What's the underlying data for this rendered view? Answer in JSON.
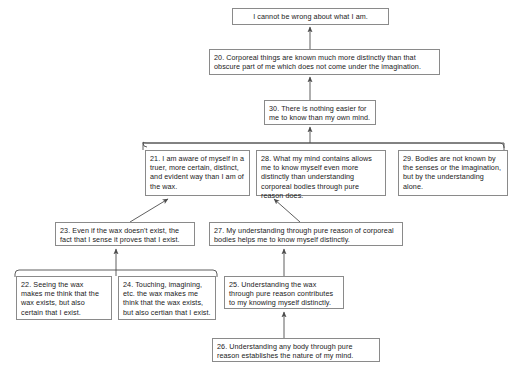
{
  "diagram": {
    "style": {
      "box_border_color": "#8a8a8a",
      "box_fill_color": "#ffffff",
      "text_color": "#1a1a1a",
      "edge_color": "#4d4d4d",
      "background_color": "#ffffff"
    },
    "nodes": [
      {
        "id": "conclusion",
        "number": "",
        "text": "I cannot be wrong about what I am.",
        "x": 232,
        "y": 8,
        "w": 157,
        "h": 17,
        "align": "center"
      },
      {
        "id": "n20",
        "number": "20",
        "text": "20. Corporeal things are known much more distinctly than that obscure part of me which does not come under the imagination.",
        "x": 209,
        "y": 49,
        "w": 231,
        "h": 26,
        "align": "left"
      },
      {
        "id": "n30",
        "number": "30",
        "text": "30. There is nothing easier for me to know than my own mind.",
        "x": 264,
        "y": 100,
        "w": 112,
        "h": 25,
        "align": "left"
      },
      {
        "id": "n21",
        "number": "21",
        "text": "21. I am aware of myself in a truer, more certain, distinct, and evident way than I am of the wax.",
        "x": 145,
        "y": 150,
        "w": 105,
        "h": 46,
        "align": "left"
      },
      {
        "id": "n28",
        "number": "28",
        "text": "28. What my mind contains allows me to know myself even more distinctly than understanding corporeal bodies through pure reason does.",
        "x": 256,
        "y": 150,
        "w": 130,
        "h": 46,
        "align": "left"
      },
      {
        "id": "n29",
        "number": "29",
        "text": "29. Bodies are not known by the senses or the imagination, but by the understanding alone.",
        "x": 398,
        "y": 150,
        "w": 110,
        "h": 46,
        "align": "left"
      },
      {
        "id": "n23",
        "number": "23",
        "text": "23. Even if the wax doesn't exist, the fact that I sense it proves that I exist.",
        "x": 55,
        "y": 222,
        "w": 140,
        "h": 24,
        "align": "left"
      },
      {
        "id": "n27",
        "number": "27",
        "text": "27. My understanding through pure reason of corporeal bodies helps me to know myself distinctly.",
        "x": 209,
        "y": 222,
        "w": 194,
        "h": 24,
        "align": "left"
      },
      {
        "id": "n22",
        "number": "22",
        "text": "22. Seeing the wax makes me think that the wax exists, but also certain that I exist.",
        "x": 16,
        "y": 276,
        "w": 96,
        "h": 44,
        "align": "left"
      },
      {
        "id": "n24",
        "number": "24",
        "text": "24. Touching, imagining, etc. the wax makes me think that the wax exists, but also certian that I exist.",
        "x": 118,
        "y": 276,
        "w": 98,
        "h": 44,
        "align": "left"
      },
      {
        "id": "n25",
        "number": "25",
        "text": "25. Understanding the wax through pure reason contributes to my knowing myself distinctly.",
        "x": 224,
        "y": 276,
        "w": 120,
        "h": 33,
        "align": "left"
      },
      {
        "id": "n26",
        "number": "26",
        "text": "26. Understanding any body through pure reason establishes the nature of my mind.",
        "x": 212,
        "y": 338,
        "w": 168,
        "h": 24,
        "align": "left"
      }
    ]
  }
}
